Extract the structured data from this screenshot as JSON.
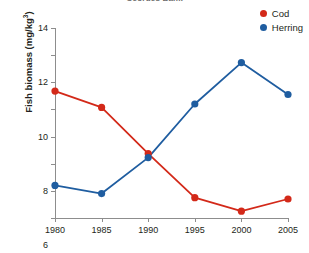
{
  "chart_data": {
    "type": "line",
    "title": "Georges Bank",
    "xlabel": "",
    "ylabel": "Fish biomass (mg/kg³)",
    "ylabel_text": "Fish biomass (mg/kg",
    "ylabel_sup": "3",
    "ylabel_tail": ")",
    "categories": [
      1980,
      1985,
      1990,
      1995,
      2000,
      2005
    ],
    "x": [
      1980,
      1985,
      1990,
      1995,
      2000,
      2005
    ],
    "xtick_labels": [
      "1980",
      "1985",
      "1990",
      "1995",
      "2000",
      "2005"
    ],
    "ytick_labels": [
      "0",
      "2",
      "4",
      "6",
      "8",
      "10",
      "12",
      "14"
    ],
    "yticks": [
      0,
      2,
      4,
      6,
      8,
      10,
      12,
      14
    ],
    "xlim": [
      1980,
      2005
    ],
    "ylim": [
      0,
      14
    ],
    "grid": false,
    "legend_position": "top-right",
    "series": [
      {
        "name": "Cod",
        "color": "#d32919",
        "values": [
          9.35,
          8.15,
          4.75,
          1.5,
          0.5,
          1.4
        ]
      },
      {
        "name": "Herring",
        "color": "#1f5da0",
        "values": [
          2.4,
          1.8,
          4.45,
          8.4,
          11.45,
          9.1
        ]
      }
    ]
  },
  "colors": {
    "cod": "#d32919",
    "herring": "#1f5da0",
    "axis": "#8d8d8d",
    "text": "#231f20",
    "background": "#ffffff"
  }
}
